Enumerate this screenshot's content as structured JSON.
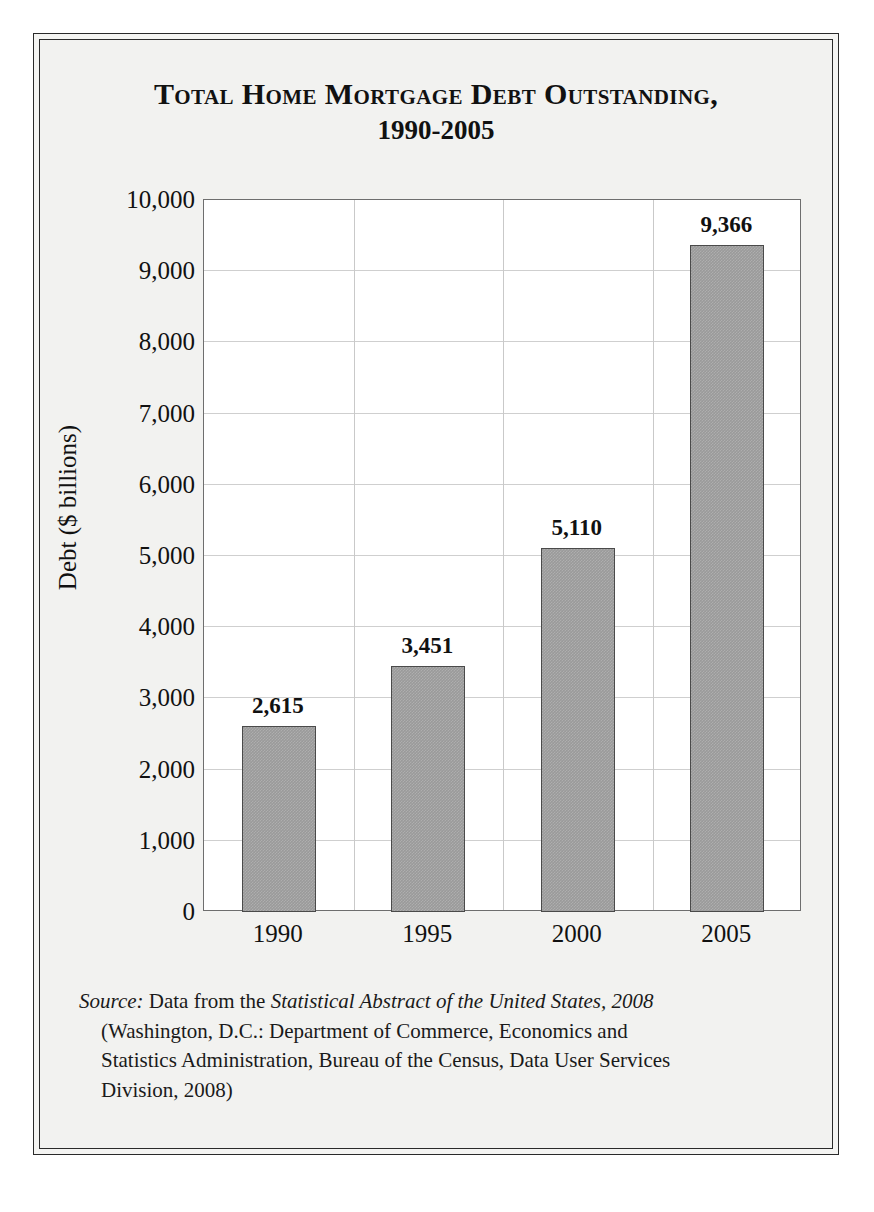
{
  "figure": {
    "title_line1": "Total Home Mortgage Debt Outstanding,",
    "title_line2": "1990-2005"
  },
  "source": {
    "label": "Source:",
    "lead": " Data from the ",
    "work": "Statistical Abstract of the United States, 2008",
    "line2": "(Washington, D.C.: Department of Commerce, Economics and",
    "line3": "Statistics Administration, Bureau of the Census, Data User Services",
    "line4": "Division, 2008)"
  },
  "colors": {
    "bar_fill": "#9a9a9a",
    "bar_stroke": "#4a4a4a",
    "grid": "#cfcfcf",
    "axis": "#6e6e6e",
    "frame": "#2a2a2a",
    "page_background": "#f2f2f0",
    "plot_background": "#ffffff"
  },
  "chart_data": {
    "type": "bar",
    "title": "Total Home Mortgage Debt Outstanding, 1990-2005",
    "xlabel": "",
    "ylabel": "Debt ($ billions)",
    "categories": [
      "1990",
      "1995",
      "2000",
      "2005"
    ],
    "values": [
      2615,
      3451,
      5110,
      9366
    ],
    "data_labels": [
      "2,615",
      "3,451",
      "5,110",
      "9,366"
    ],
    "ylim": [
      0,
      10000
    ],
    "ytick_values": [
      0,
      1000,
      2000,
      3000,
      4000,
      5000,
      6000,
      7000,
      8000,
      9000,
      10000
    ],
    "ytick_labels": [
      "0",
      "1,000",
      "2,000",
      "3,000",
      "4,000",
      "5,000",
      "6,000",
      "7,000",
      "8,000",
      "9,000",
      "10,000"
    ],
    "grid": true,
    "legend": false,
    "series": [
      {
        "name": "Home mortgage debt outstanding",
        "values": [
          2615,
          3451,
          5110,
          9366
        ]
      }
    ]
  }
}
